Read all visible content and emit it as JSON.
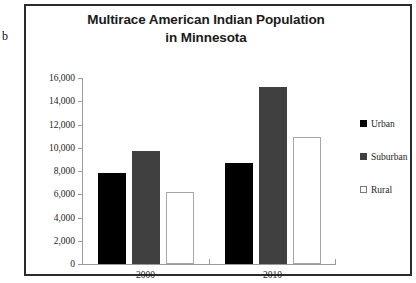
{
  "figure": {
    "label": "b"
  },
  "chart_data": {
    "type": "bar",
    "title": "Multirace American Indian Population in Minnesota",
    "title_line1": "Multirace American Indian Population",
    "title_line2": "in Minnesota",
    "xlabel": "",
    "ylabel": "",
    "categories": [
      "2000",
      "2010"
    ],
    "series": [
      {
        "name": "Urban",
        "color": "#000000",
        "values": [
          7800,
          8700
        ]
      },
      {
        "name": "Suburban",
        "color": "#404040",
        "values": [
          9700,
          15200
        ]
      },
      {
        "name": "Rural",
        "color": "#ffffff",
        "values": [
          6200,
          10900
        ]
      }
    ],
    "ylim": [
      0,
      16000
    ],
    "ytick_labels": [
      "16,000",
      "14,000",
      "12,000",
      "10,000",
      "8,000",
      "6,000",
      "4,000",
      "2,000",
      "0"
    ],
    "ytick_values": [
      16000,
      14000,
      12000,
      10000,
      8000,
      6000,
      4000,
      2000,
      0
    ],
    "grid": false,
    "legend_position": "right",
    "legend": [
      "Urban",
      "Suburban",
      "Rural"
    ]
  }
}
